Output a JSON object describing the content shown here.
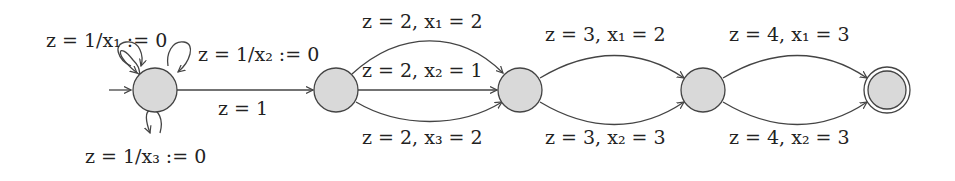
{
  "diagram": {
    "type": "automaton",
    "colors": {
      "state_fill": "#d9d9d9",
      "stroke": "#444444",
      "text": "#222222"
    },
    "states": [
      {
        "id": "q0",
        "initial": true,
        "accepting": false
      },
      {
        "id": "q1",
        "initial": false,
        "accepting": false
      },
      {
        "id": "q2",
        "initial": false,
        "accepting": false
      },
      {
        "id": "q3",
        "initial": false,
        "accepting": false
      },
      {
        "id": "q4",
        "initial": false,
        "accepting": true
      }
    ],
    "edges": [
      {
        "from": "q0",
        "to": "q0",
        "label": "z = 1/x₁ := 0"
      },
      {
        "from": "q0",
        "to": "q0",
        "label": "z = 1/x₂ := 0"
      },
      {
        "from": "q0",
        "to": "q0",
        "label": "z = 1/x₃ := 0"
      },
      {
        "from": "q0",
        "to": "q1",
        "label": "z = 1"
      },
      {
        "from": "q1",
        "to": "q2",
        "label": "z = 2, x₁ = 2"
      },
      {
        "from": "q1",
        "to": "q2",
        "label": "z = 2, x₂ = 1"
      },
      {
        "from": "q1",
        "to": "q2",
        "label": "z = 2, x₃ = 2"
      },
      {
        "from": "q2",
        "to": "q3",
        "label": "z = 3, x₁ = 2"
      },
      {
        "from": "q2",
        "to": "q3",
        "label": "z = 3, x₂ = 3"
      },
      {
        "from": "q3",
        "to": "q4",
        "label": "z = 4, x₁ = 3"
      },
      {
        "from": "q3",
        "to": "q4",
        "label": "z = 4, x₂ = 3"
      }
    ]
  }
}
